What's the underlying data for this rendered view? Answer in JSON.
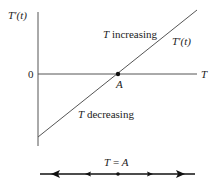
{
  "diagram": {
    "y_axis_label": "T'(t)",
    "x_axis_label": "T",
    "zero_label": "0",
    "point_label": "A",
    "line_label": "T'(t)",
    "region_upper_label": "T increasing",
    "region_lower_label": "T decreasing",
    "phase_line_label": "T = A",
    "colors": {
      "line": "#444444",
      "text": "#222222"
    }
  }
}
